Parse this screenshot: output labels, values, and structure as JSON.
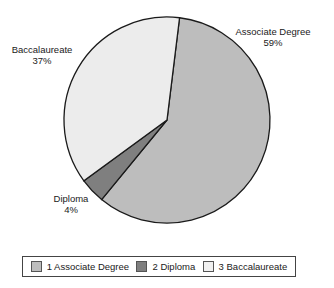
{
  "chart_data": {
    "type": "pie",
    "title": "",
    "categories": [
      "Associate Degree",
      "Diploma",
      "Baccalaureate"
    ],
    "values": [
      59,
      4,
      37
    ],
    "unit": "%",
    "colors": [
      "#bdbdbd",
      "#7f7f7f",
      "#ececec"
    ],
    "start_angle_deg": 7,
    "legend_position": "bottom",
    "labels": [
      {
        "name": "Associate Degree",
        "pct": "59%"
      },
      {
        "name": "Diploma",
        "pct": "4%"
      },
      {
        "name": "Baccalaureate",
        "pct": "37%"
      }
    ],
    "legend": [
      "1 Associate Degree",
      "2 Diploma",
      "3 Baccalaureate"
    ]
  }
}
